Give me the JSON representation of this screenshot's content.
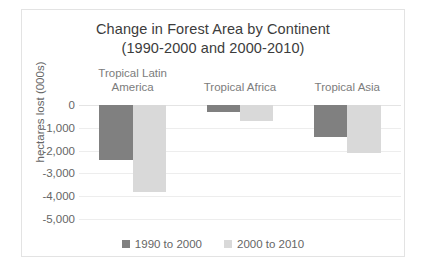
{
  "chart_data": {
    "type": "bar",
    "title": "Change in Forest Area by Continent",
    "subtitle": "(1990-2000 and 2000-2010)",
    "title_line1": "Change in Forest Area by Continent",
    "title_line2": "(1990-2000 and 2000-2010)",
    "xlabel": "",
    "ylabel": "hectares lost (000s)",
    "ylim": [
      -5000,
      0
    ],
    "ytick_labels": [
      "0",
      "-1,000",
      "-2,000",
      "-3,000",
      "-4,000",
      "-5,000"
    ],
    "ytick_values": [
      0,
      -1000,
      -2000,
      -3000,
      -4000,
      -5000
    ],
    "grid": true,
    "legend_position": "bottom",
    "categories": [
      "Tropical Latin America",
      "Tropical Africa",
      "Tropical Asia"
    ],
    "category_label_lines": [
      [
        "Tropical Latin",
        "America"
      ],
      [
        "Tropical Africa"
      ],
      [
        "Tropical Asia"
      ]
    ],
    "series": [
      {
        "name": "1990 to 2000",
        "color": "#808080",
        "values": [
          -2400,
          -300,
          -1400
        ]
      },
      {
        "name": "2000 to 2010",
        "color": "#d9d9d9",
        "values": [
          -3800,
          -700,
          -2100
        ]
      }
    ]
  },
  "colors": {
    "series1": "#808080",
    "series2": "#d9d9d9",
    "gridline": "#ededed",
    "frame_border": "#e3e3e3",
    "title_text": "#3c3c3c",
    "axis_text": "#666666",
    "category_text": "#7c7c7c"
  }
}
